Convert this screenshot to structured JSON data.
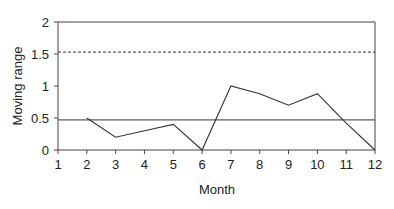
{
  "chart_data": {
    "type": "line",
    "title": "",
    "xlabel": "Month",
    "ylabel": "Moving range",
    "x": [
      2,
      3,
      4,
      5,
      6,
      7,
      8,
      9,
      10,
      11,
      12
    ],
    "series": [
      {
        "name": "Moving range",
        "values": [
          0.5,
          0.2,
          0.3,
          0.4,
          0.0,
          1.0,
          0.88,
          0.7,
          0.88,
          0.42,
          0.0
        ],
        "style": "solid",
        "color": "#333333"
      }
    ],
    "reference_lines": [
      {
        "name": "Upper control limit",
        "value": 1.53,
        "style": "dashed",
        "color": "#333333"
      },
      {
        "name": "Mean moving range",
        "value": 0.47,
        "style": "solid",
        "color": "#333333"
      }
    ],
    "xlim": [
      1,
      12
    ],
    "ylim": [
      0,
      2
    ],
    "x_ticks": [
      "1",
      "2",
      "3",
      "4",
      "5",
      "6",
      "7",
      "8",
      "9",
      "10",
      "11",
      "12"
    ],
    "y_ticks": [
      "0",
      "0.5",
      "1",
      "1.5",
      "2"
    ],
    "grid": false,
    "legend": null
  },
  "axes": {
    "xlabel": "Month",
    "ylabel": "Moving range",
    "x_ticks": [
      "1",
      "2",
      "3",
      "4",
      "5",
      "6",
      "7",
      "8",
      "9",
      "10",
      "11",
      "12"
    ],
    "y_ticks": [
      "0",
      "0.5",
      "1",
      "1.5",
      "2"
    ]
  }
}
